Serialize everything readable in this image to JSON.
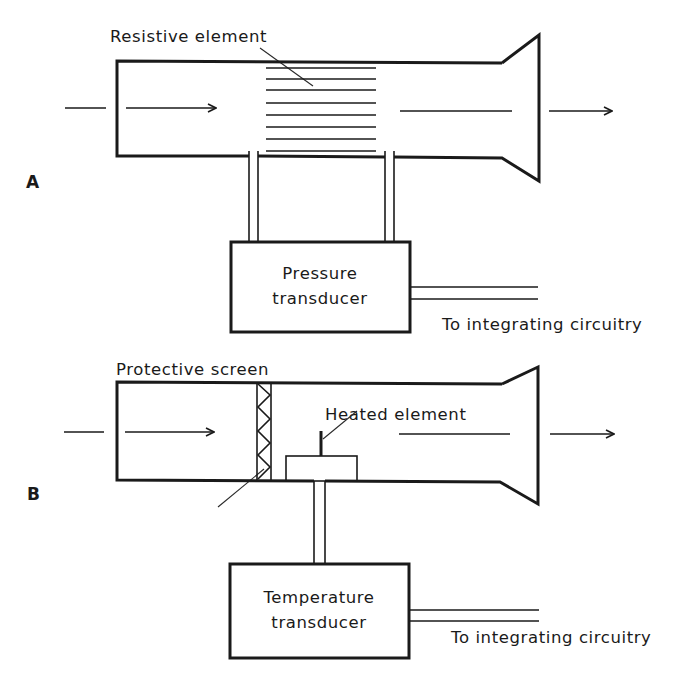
{
  "figure": {
    "panels": [
      {
        "id": "A",
        "label": "A",
        "annotation": "Resistive element",
        "transducer_line1": "Pressure",
        "transducer_line2": "transducer",
        "output_label": "To integrating circuitry",
        "resistive_line_count": 8
      },
      {
        "id": "B",
        "label": "B",
        "annotation_screen": "Protective screen",
        "annotation_heated": "Heated element",
        "transducer_line1": "Temperature",
        "transducer_line2": "transducer",
        "output_label": "To integrating circuitry"
      }
    ],
    "colors": {
      "ink": "#1a1a1a",
      "background": "#ffffff"
    },
    "icons": {
      "flow_in": "arrow-right-icon",
      "flow_out": "arrow-right-icon"
    }
  }
}
